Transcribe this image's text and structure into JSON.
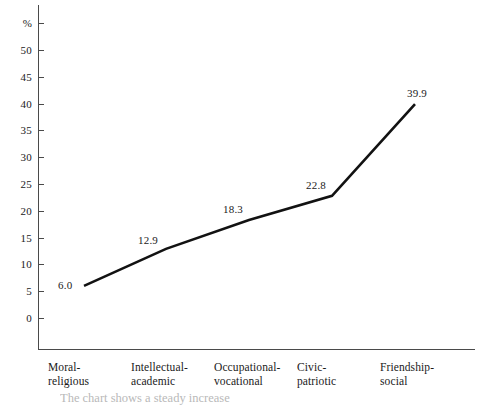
{
  "chart_data": {
    "type": "line",
    "title": "",
    "xlabel": "",
    "ylabel": "%",
    "ylim": [
      0,
      55
    ],
    "ytick_step": 5,
    "grid": false,
    "legend": "none",
    "line_color": "#121212",
    "categories": [
      "Moral-religious",
      "Intellectual-academic",
      "Occupational-vocational",
      "Civic-patriotic",
      "Friendship-social"
    ],
    "category_lines": [
      [
        "Moral-",
        "religious"
      ],
      [
        "Intellectual-",
        "academic"
      ],
      [
        "Occupational-",
        "vocational"
      ],
      [
        "Civic-",
        "patriotic"
      ],
      [
        "Friendship-",
        "social"
      ]
    ],
    "values": [
      6.0,
      12.9,
      18.3,
      22.8,
      39.9
    ],
    "point_labels": [
      "6.0",
      "12.9",
      "18.3",
      "22.8",
      "39.9"
    ],
    "yticks": [
      {
        "label": "%",
        "value": 55
      },
      {
        "label": "50",
        "value": 50
      },
      {
        "label": "45",
        "value": 45
      },
      {
        "label": "40",
        "value": 40
      },
      {
        "label": "35",
        "value": 35
      },
      {
        "label": "30",
        "value": 30
      },
      {
        "label": "25",
        "value": 25
      },
      {
        "label": "20",
        "value": 20
      },
      {
        "label": "15",
        "value": 15
      },
      {
        "label": "10",
        "value": 10
      },
      {
        "label": "5",
        "value": 5
      },
      {
        "label": "0",
        "value": 0
      }
    ]
  },
  "caption": {
    "cropped_text": "The chart shows a steady increase"
  }
}
